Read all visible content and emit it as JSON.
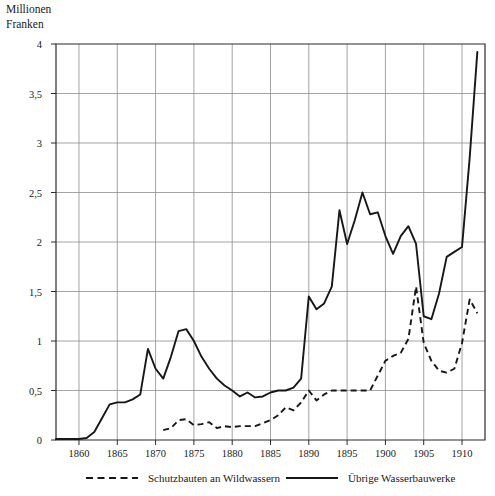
{
  "axis_unit": {
    "line1": "Millionen",
    "line2": "Franken"
  },
  "legend": [
    {
      "label": "Schutzbauten an Wildwassern",
      "style": "dashed",
      "swatch": "dashed-line-icon"
    },
    {
      "label": "Übrige Wasserbauwerke",
      "style": "solid",
      "swatch": "solid-line-icon"
    }
  ],
  "chart_data": {
    "type": "line",
    "title": "",
    "subtitle": "",
    "xlabel": "",
    "ylabel": "Millionen Franken",
    "xlim": [
      1857,
      1913
    ],
    "ylim": [
      0,
      4
    ],
    "xticks": [
      1860,
      1865,
      1870,
      1875,
      1880,
      1885,
      1890,
      1895,
      1900,
      1905,
      1910
    ],
    "yticks": [
      0,
      0.5,
      1,
      1.5,
      2,
      2.5,
      3,
      3.5,
      4
    ],
    "ytick_labels": [
      "0",
      "0,5",
      "1",
      "1,5",
      "2",
      "2,5",
      "3",
      "3,5",
      "4"
    ],
    "xtick_labels": [
      "1860",
      "1865",
      "1870",
      "1875",
      "1880",
      "1885",
      "1890",
      "1895",
      "1900",
      "1905",
      "1910"
    ],
    "grid": true,
    "legend_position": "below",
    "series": [
      {
        "name": "Übrige Wasserbauwerke",
        "style": "solid",
        "x": [
          1857,
          1858,
          1859,
          1860,
          1861,
          1862,
          1863,
          1864,
          1865,
          1866,
          1867,
          1868,
          1869,
          1870,
          1871,
          1872,
          1873,
          1874,
          1875,
          1876,
          1877,
          1878,
          1879,
          1880,
          1881,
          1882,
          1883,
          1884,
          1885,
          1886,
          1887,
          1888,
          1889,
          1890,
          1891,
          1892,
          1893,
          1894,
          1895,
          1896,
          1897,
          1898,
          1899,
          1900,
          1901,
          1902,
          1903,
          1904,
          1905,
          1906,
          1907,
          1908,
          1909,
          1910,
          1911,
          1912
        ],
        "values": [
          0.01,
          0.01,
          0.01,
          0.01,
          0.02,
          0.08,
          0.22,
          0.36,
          0.38,
          0.38,
          0.41,
          0.46,
          0.92,
          0.72,
          0.62,
          0.84,
          1.1,
          1.12,
          1.0,
          0.84,
          0.72,
          0.62,
          0.55,
          0.5,
          0.44,
          0.48,
          0.43,
          0.44,
          0.48,
          0.5,
          0.5,
          0.53,
          0.62,
          1.45,
          1.32,
          1.38,
          1.55,
          2.32,
          1.98,
          2.22,
          2.5,
          2.28,
          2.3,
          2.06,
          1.88,
          2.06,
          2.16,
          1.98,
          1.25,
          1.22,
          1.48,
          1.85,
          1.9,
          1.95,
          2.85,
          3.92
        ]
      },
      {
        "name": "Schutzbauten an Wildwassern",
        "style": "dashed",
        "x": [
          1871,
          1872,
          1873,
          1874,
          1875,
          1876,
          1877,
          1878,
          1879,
          1880,
          1881,
          1882,
          1883,
          1884,
          1885,
          1886,
          1887,
          1888,
          1889,
          1890,
          1891,
          1892,
          1893,
          1894,
          1895,
          1896,
          1897,
          1898,
          1899,
          1900,
          1901,
          1902,
          1903,
          1904,
          1905,
          1906,
          1907,
          1908,
          1909,
          1910,
          1911,
          1912
        ],
        "values": [
          0.1,
          0.12,
          0.2,
          0.21,
          0.15,
          0.16,
          0.18,
          0.12,
          0.14,
          0.13,
          0.14,
          0.14,
          0.14,
          0.17,
          0.2,
          0.25,
          0.33,
          0.3,
          0.38,
          0.5,
          0.4,
          0.46,
          0.5,
          0.5,
          0.5,
          0.5,
          0.5,
          0.5,
          0.65,
          0.8,
          0.85,
          0.88,
          1.02,
          1.55,
          0.98,
          0.8,
          0.7,
          0.68,
          0.72,
          0.98,
          1.42,
          1.28
        ]
      }
    ]
  }
}
